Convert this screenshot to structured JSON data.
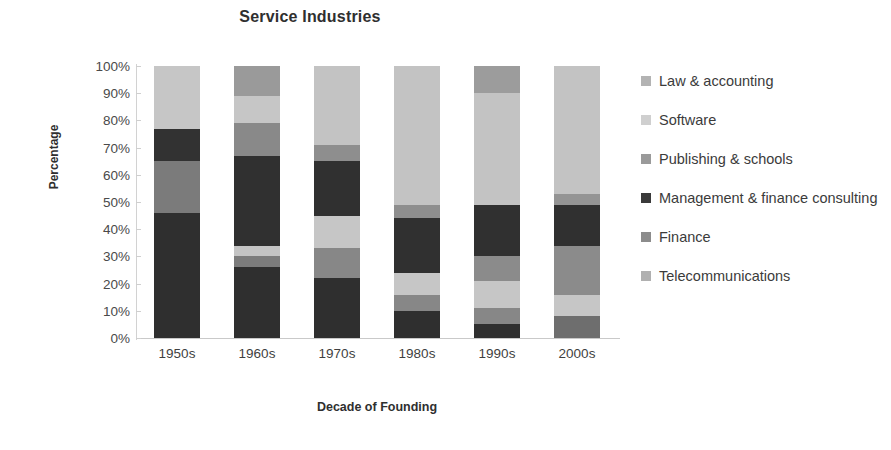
{
  "chart_data": {
    "type": "bar",
    "subtype": "stacked-100-percent",
    "title": "Service Industries",
    "xlabel": "Decade of Founding",
    "ylabel": "Percentage",
    "categories": [
      "1950s",
      "1960s",
      "1970s",
      "1980s",
      "1990s",
      "2000s"
    ],
    "ylim": [
      0,
      100
    ],
    "ytick_labels": [
      "0%",
      "10%",
      "20%",
      "30%",
      "40%",
      "50%",
      "60%",
      "70%",
      "80%",
      "90%",
      "100%"
    ],
    "ytick_values": [
      0,
      10,
      20,
      30,
      40,
      50,
      60,
      70,
      80,
      90,
      100
    ],
    "grid": false,
    "legend_position": "right",
    "series": [
      {
        "name": "Telecommunications",
        "color": "#8f8f8f",
        "values": [
          0,
          26,
          22,
          10,
          5,
          0
        ]
      },
      {
        "name": "Finance",
        "color": "#707070",
        "values": [
          0,
          4,
          11,
          6,
          6,
          8
        ]
      },
      {
        "name": "Management & finance consulting",
        "color": "#333333",
        "values": [
          46,
          4,
          12,
          8,
          10,
          8
        ]
      },
      {
        "name": "Publishing & schools",
        "color": "#7d7d7d",
        "values": [
          19,
          33,
          20,
          20,
          19,
          18
        ]
      },
      {
        "name": "Software",
        "color": "#cfcfcf",
        "values": [
          0,
          12,
          6,
          5,
          9,
          4
        ]
      },
      {
        "name": "Law & accounting",
        "color": "#b3b3b3",
        "values": [
          12,
          10,
          29,
          51,
          41,
          47
        ]
      }
    ],
    "top_cap_series": {
      "name": "Telecommunications",
      "note": "top cap segment present on 1960s and 1990s bars",
      "values": [
        23,
        11,
        0,
        0,
        10,
        15
      ]
    }
  },
  "legend": {
    "items": [
      {
        "label": "Law & accounting",
        "color": "#b3b3b3"
      },
      {
        "label": "Software",
        "color": "#cfcfcf"
      },
      {
        "label": "Publishing & schools",
        "color": "#9a9a9a"
      },
      {
        "label": "Management & finance consulting",
        "color": "#3a3a3a"
      },
      {
        "label": "Finance",
        "color": "#8c8c8c"
      },
      {
        "label": "Telecommunications",
        "color": "#b0b0b0"
      }
    ]
  },
  "bars": [
    {
      "category": "1950s",
      "segments": [
        {
          "series": "Management & finance consulting",
          "value": 46,
          "color": "#2f2f2f"
        },
        {
          "series": "Publishing & schools",
          "value": 19,
          "color": "#7b7b7b"
        },
        {
          "series": "Management & finance consulting",
          "value": 12,
          "color": "#323232"
        },
        {
          "series": "Law & accounting",
          "value": 23,
          "color": "#c6c6c6"
        }
      ]
    },
    {
      "category": "1960s",
      "segments": [
        {
          "series": "Management & finance consulting",
          "value": 26,
          "color": "#2f2f2f"
        },
        {
          "series": "Finance",
          "value": 4,
          "color": "#7c7c7c"
        },
        {
          "series": "Software",
          "value": 4,
          "color": "#c4c4c4"
        },
        {
          "series": "Management & finance consulting",
          "value": 33,
          "color": "#303030"
        },
        {
          "series": "Publishing & schools",
          "value": 12,
          "color": "#898989"
        },
        {
          "series": "Law & accounting",
          "value": 10,
          "color": "#c6c6c6"
        },
        {
          "series": "Telecommunications",
          "value": 11,
          "color": "#9a9a9a"
        }
      ]
    },
    {
      "category": "1970s",
      "segments": [
        {
          "series": "Management & finance consulting",
          "value": 22,
          "color": "#2f2f2f"
        },
        {
          "series": "Publishing & schools",
          "value": 11,
          "color": "#878787"
        },
        {
          "series": "Software",
          "value": 12,
          "color": "#c6c6c6"
        },
        {
          "series": "Management & finance consulting",
          "value": 20,
          "color": "#303030"
        },
        {
          "series": "Publishing & schools",
          "value": 6,
          "color": "#8e8e8e"
        },
        {
          "series": "Law & accounting",
          "value": 29,
          "color": "#c3c3c3"
        }
      ]
    },
    {
      "category": "1980s",
      "segments": [
        {
          "series": "Management & finance consulting",
          "value": 10,
          "color": "#2f2f2f"
        },
        {
          "series": "Publishing & schools",
          "value": 6,
          "color": "#878787"
        },
        {
          "series": "Software",
          "value": 8,
          "color": "#c6c6c6"
        },
        {
          "series": "Management & finance consulting",
          "value": 20,
          "color": "#303030"
        },
        {
          "series": "Publishing & schools",
          "value": 5,
          "color": "#8e8e8e"
        },
        {
          "series": "Law & accounting",
          "value": 51,
          "color": "#c3c3c3"
        }
      ]
    },
    {
      "category": "1990s",
      "segments": [
        {
          "series": "Management & finance consulting",
          "value": 5,
          "color": "#2f2f2f"
        },
        {
          "series": "Publishing & schools",
          "value": 6,
          "color": "#878787"
        },
        {
          "series": "Software",
          "value": 10,
          "color": "#c6c6c6"
        },
        {
          "series": "Publishing & schools",
          "value": 9,
          "color": "#8b8b8b"
        },
        {
          "series": "Management & finance consulting",
          "value": 19,
          "color": "#303030"
        },
        {
          "series": "Law & accounting",
          "value": 41,
          "color": "#c3c3c3"
        },
        {
          "series": "Telecommunications",
          "value": 10,
          "color": "#9c9c9c"
        }
      ]
    },
    {
      "category": "2000s",
      "segments": [
        {
          "series": "Finance",
          "value": 8,
          "color": "#6e6e6e"
        },
        {
          "series": "Software",
          "value": 8,
          "color": "#c6c6c6"
        },
        {
          "series": "Publishing & schools",
          "value": 18,
          "color": "#8b8b8b"
        },
        {
          "series": "Management & finance consulting",
          "value": 15,
          "color": "#303030"
        },
        {
          "series": "Publishing & schools",
          "value": 4,
          "color": "#949494"
        },
        {
          "series": "Law & accounting",
          "value": 47,
          "color": "#c3c3c3"
        }
      ]
    }
  ]
}
